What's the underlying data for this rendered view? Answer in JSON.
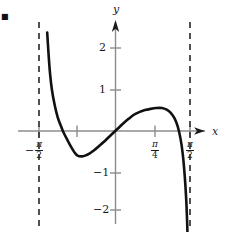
{
  "figure": {
    "bullet_marker": "■",
    "axes": {
      "x_label": "x",
      "y_label": "y"
    },
    "y_ticks": [
      {
        "label": "2",
        "value": 2
      },
      {
        "label": "1",
        "value": 1
      },
      {
        "label": "−1",
        "value": -1
      },
      {
        "label": "−2",
        "value": -2
      }
    ],
    "x_ticks": [
      {
        "label": "−π/2",
        "sign": "−",
        "numerator": "π",
        "denominator": "2"
      },
      {
        "label": "π/4",
        "sign": "",
        "numerator": "π",
        "denominator": "4"
      },
      {
        "label": "π/2",
        "sign": "",
        "numerator": "π",
        "denominator": "2"
      }
    ],
    "asymptotes": [
      {
        "name": "left-asymptote",
        "x_label": "−π/2",
        "style": "dashed"
      },
      {
        "name": "right-asymptote",
        "x_label": "π/2",
        "style": "dashed"
      }
    ],
    "colors": {
      "curve": "#111111",
      "axis": "#8c8c8c",
      "asymptote": "#333333",
      "text": "#1a1a1a",
      "background": "#ffffff"
    }
  },
  "chart_data": {
    "type": "line",
    "title": "",
    "xlabel": "x",
    "ylabel": "y",
    "grid": false,
    "legend": null,
    "xlim": [
      -1.5708,
      1.5708
    ],
    "ylim": [
      -2.6,
      2.7
    ],
    "xtick_values": [
      -1.5708,
      0.7854,
      1.5708
    ],
    "xtick_labels": [
      "−π/2",
      "π/4",
      "π/2"
    ],
    "ytick_values": [
      2,
      1,
      -1,
      -2
    ],
    "ytick_labels": [
      "2",
      "1",
      "−1",
      "−2"
    ],
    "asymptote_x": [
      -1.5708,
      1.5708
    ],
    "annotations": [
      {
        "kind": "local-minimum",
        "x": -0.82,
        "y": -0.6
      },
      {
        "kind": "local-maximum",
        "x": 0.98,
        "y": 0.56
      },
      {
        "kind": "x-intercept",
        "x": 0.0,
        "y": 0.0
      },
      {
        "kind": "x-intercept",
        "x": 1.48,
        "y": 0.0
      }
    ],
    "series": [
      {
        "name": "curve",
        "points": [
          [
            -1.44,
            2.4
          ],
          [
            -1.41,
            1.85
          ],
          [
            -1.38,
            1.4
          ],
          [
            -1.34,
            1.0
          ],
          [
            -1.28,
            0.62
          ],
          [
            -1.22,
            0.34
          ],
          [
            -1.15,
            0.12
          ],
          [
            -1.09,
            -0.05
          ],
          [
            -1.0,
            -0.25
          ],
          [
            -0.93,
            -0.4
          ],
          [
            -0.86,
            -0.53
          ],
          [
            -0.8,
            -0.6
          ],
          [
            -0.72,
            -0.62
          ],
          [
            -0.64,
            -0.6
          ],
          [
            -0.55,
            -0.55
          ],
          [
            -0.45,
            -0.47
          ],
          [
            -0.35,
            -0.37
          ],
          [
            -0.25,
            -0.27
          ],
          [
            -0.15,
            -0.16
          ],
          [
            -0.05,
            -0.05
          ],
          [
            0.05,
            0.06
          ],
          [
            0.15,
            0.17
          ],
          [
            0.27,
            0.29
          ],
          [
            0.38,
            0.39
          ],
          [
            0.5,
            0.46
          ],
          [
            0.62,
            0.51
          ],
          [
            0.74,
            0.54
          ],
          [
            0.86,
            0.56
          ],
          [
            0.98,
            0.56
          ],
          [
            1.08,
            0.52
          ],
          [
            1.16,
            0.45
          ],
          [
            1.24,
            0.32
          ],
          [
            1.31,
            0.12
          ],
          [
            1.37,
            -0.18
          ],
          [
            1.42,
            -0.58
          ],
          [
            1.46,
            -1.1
          ],
          [
            1.49,
            -1.65
          ],
          [
            1.51,
            -2.2
          ],
          [
            1.52,
            -2.6
          ]
        ]
      }
    ]
  }
}
